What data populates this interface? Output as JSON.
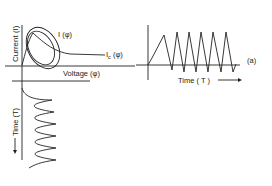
{
  "figure": {
    "label": "(a)",
    "colors": {
      "line": "#222222",
      "background": "#ffffff"
    }
  },
  "phase_plot": {
    "y_axis_label": "Current (I)",
    "x_axis_label": "Voltage (φ)",
    "curve_loop_label": "I (φ)",
    "curve_c_label_main": "I",
    "curve_c_label_sub": "c",
    "curve_c_label_arg": " (φ)"
  },
  "time_plot_right": {
    "x_axis_label": "Time ( T )",
    "arrow": "—→"
  },
  "time_plot_bottom": {
    "axis_label": "Time (T)",
    "arrow": "←"
  }
}
